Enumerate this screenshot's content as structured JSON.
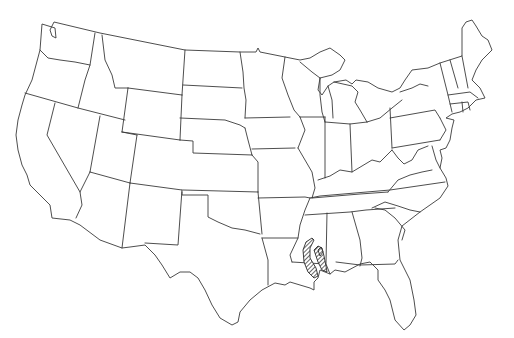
{
  "map": {
    "title": "Contiguous United States outline map",
    "region": "United States (lower 48)",
    "highlighted_area": {
      "label": "Hatched range area",
      "location": "Southern Mississippi / southwestern Alabama border",
      "pattern": "diagonal hatching"
    },
    "colors": {
      "background": "#ffffff",
      "border_stroke": "#3a3a3a",
      "hatch": "#2a2a2a"
    }
  }
}
